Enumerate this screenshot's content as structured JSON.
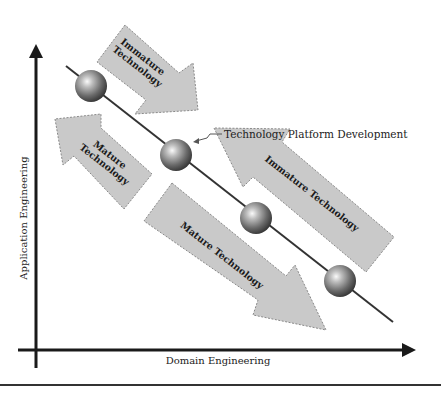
{
  "diagram": {
    "axes": {
      "y_label": "Application Engineering",
      "x_label": "Domain Engineering"
    },
    "callout": {
      "label": "Technology Platform Development"
    },
    "arrows": [
      {
        "id": "immature-small",
        "direction": "down-right",
        "line1": "Immature",
        "line2": "Technology"
      },
      {
        "id": "mature-small",
        "direction": "up-left",
        "line1": "Mature",
        "line2": "Technology"
      },
      {
        "id": "immature-large",
        "direction": "up-left",
        "label": "Immature Technology"
      },
      {
        "id": "mature-large",
        "direction": "down-right",
        "label": "Mature Technology"
      }
    ],
    "nodes": [
      {
        "id": "node-1"
      },
      {
        "id": "node-2",
        "callout": true
      },
      {
        "id": "node-3"
      },
      {
        "id": "node-4"
      }
    ],
    "colors": {
      "arrow_fill": "#c9c9c9",
      "arrow_border": "#8a8a8a",
      "axis": "#1a1a1a",
      "sphere_dark": "#3a3a3a",
      "sphere_light": "#f2f2f2"
    }
  }
}
